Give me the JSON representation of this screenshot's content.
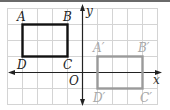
{
  "figure": {
    "axes": {
      "x_label": "x",
      "y_label": "y",
      "origin_label": "O"
    },
    "original_rectangle": {
      "vertices": [
        {
          "name": "A",
          "x": -4,
          "y": 3
        },
        {
          "name": "B",
          "x": -1,
          "y": 3
        },
        {
          "name": "C",
          "x": -1,
          "y": 1
        },
        {
          "name": "D",
          "x": -4,
          "y": 1
        }
      ],
      "stroke_color": "#111111"
    },
    "image_rectangle": {
      "vertices": [
        {
          "name": "A'",
          "x": 1,
          "y": 1
        },
        {
          "name": "B'",
          "x": 4,
          "y": 1
        },
        {
          "name": "C'",
          "x": 4,
          "y": -1
        },
        {
          "name": "D'",
          "x": 1,
          "y": -1
        }
      ],
      "stroke_color": "#9a9a9a"
    },
    "grid_color": "#d4d4d4",
    "axis_color": "#222222"
  },
  "labels": {
    "A": "A",
    "B": "B",
    "C": "C",
    "D": "D",
    "A_prime": "A′",
    "B_prime": "B′",
    "C_prime": "C′",
    "D_prime": "D′",
    "x": "x",
    "y": "y",
    "O": "O"
  }
}
